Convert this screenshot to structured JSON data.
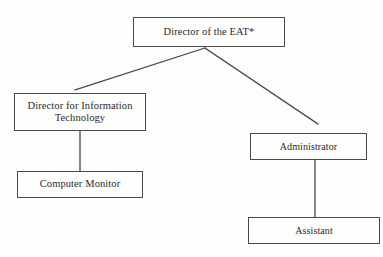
{
  "diagram": {
    "type": "organizational-chart",
    "background_color": "#fdfdfb",
    "line_color": "#4a4a4a",
    "text_color": "#2b2b2b",
    "nodes": {
      "root": {
        "label": "Director of the EAT*"
      },
      "information_technology": {
        "label": "Director for Information\nTechnology"
      },
      "computer_monitor": {
        "label": "Computer Monitor"
      },
      "administrator": {
        "label": "Administrator"
      },
      "assistant": {
        "label": "Assistant"
      }
    },
    "connectors": [
      {
        "name": "root-to-information-technology",
        "from": "root",
        "to": "information_technology",
        "style": "diagonal"
      },
      {
        "name": "root-to-administrator",
        "from": "root",
        "to": "administrator",
        "style": "diagonal"
      },
      {
        "name": "information-technology-to-computer-monitor",
        "from": "information_technology",
        "to": "computer_monitor",
        "style": "vertical"
      },
      {
        "name": "administrator-to-assistant",
        "from": "administrator",
        "to": "assistant",
        "style": "vertical"
      }
    ]
  }
}
